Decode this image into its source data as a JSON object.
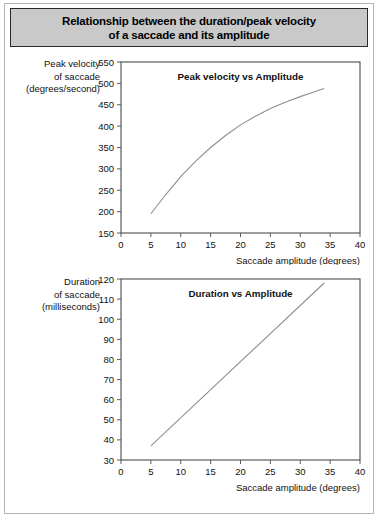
{
  "figure": {
    "title": "Relationship between the duration/peak velocity of a saccade and its amplitude",
    "title_line1": "Relationship between the duration/peak velocity",
    "title_line2": "of a saccade and its amplitude",
    "background_color": "#ffffff",
    "title_bar_color": "#c9c9c9",
    "curve_color": "#8e8e8e",
    "frame_color": "#3a3a3a"
  },
  "panel1": {
    "ylabel_line1": "Peak velocity",
    "ylabel_line2": "of saccade",
    "ylabel_line3": "(degrees/second)"
  },
  "panel2": {
    "ylabel_line1": "Duration",
    "ylabel_line2": "of saccade",
    "ylabel_line3": "(milliseconds)"
  },
  "chart_data": [
    {
      "type": "line",
      "id": "peak-velocity-vs-amplitude",
      "title": "Peak velocity vs Amplitude",
      "xlabel": "Saccade amplitude (degrees)",
      "ylabel": "Peak velocity of saccade (degrees/second)",
      "xlim": [
        0,
        40
      ],
      "ylim": [
        150,
        550
      ],
      "xticks": [
        0,
        5,
        10,
        15,
        20,
        25,
        30,
        35,
        40
      ],
      "yticks": [
        150,
        200,
        250,
        300,
        350,
        400,
        450,
        500,
        550
      ],
      "grid": false,
      "legend": "none",
      "x": [
        5,
        7.5,
        10,
        12.5,
        15,
        17.5,
        20,
        22.5,
        25,
        27.5,
        30,
        32.5,
        34
      ],
      "values": [
        195,
        240,
        282,
        318,
        350,
        378,
        403,
        423,
        441,
        456,
        469,
        481,
        488
      ]
    },
    {
      "type": "line",
      "id": "duration-vs-amplitude",
      "title": "Duration vs Amplitude",
      "xlabel": "Saccade amplitude (degrees)",
      "ylabel": "Duration of saccade (milliseconds)",
      "xlim": [
        0,
        40
      ],
      "ylim": [
        30,
        120
      ],
      "xticks": [
        0,
        5,
        10,
        15,
        20,
        25,
        30,
        35,
        40
      ],
      "yticks": [
        30,
        40,
        50,
        60,
        70,
        80,
        90,
        100,
        110,
        120
      ],
      "grid": false,
      "legend": "none",
      "x": [
        5,
        34
      ],
      "values": [
        37,
        118
      ]
    }
  ]
}
